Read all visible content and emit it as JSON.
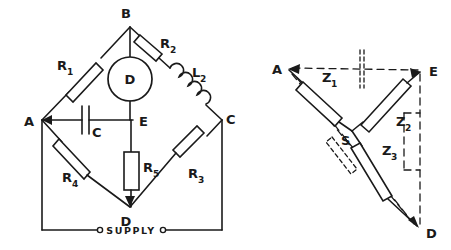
{
  "figure": {
    "background_color": "#ffffff",
    "line_color": "#1a1a1a"
  },
  "bridge": {
    "name": "ac-bridge-network",
    "nodes": [
      {
        "id": "A",
        "label": "A",
        "x": 42,
        "y": 120
      },
      {
        "id": "B",
        "label": "B",
        "x": 130,
        "y": 27
      },
      {
        "id": "C",
        "label": "C",
        "x": 222,
        "y": 120
      },
      {
        "id": "D",
        "label": "D",
        "x": 130,
        "y": 207
      },
      {
        "id": "E",
        "label": "E",
        "x": 133,
        "y": 120
      }
    ],
    "components": [
      {
        "id": "R1",
        "label": "R",
        "sub": "1",
        "type": "resistor",
        "branch": "A-B"
      },
      {
        "id": "R2",
        "label": "R",
        "sub": "2",
        "type": "resistor",
        "branch": "B-C"
      },
      {
        "id": "L2",
        "label": "L",
        "sub": "2",
        "type": "inductor",
        "branch": "B-C"
      },
      {
        "id": "R3",
        "label": "R",
        "sub": "3",
        "type": "resistor",
        "branch": "C-D"
      },
      {
        "id": "R4",
        "label": "R",
        "sub": "4",
        "type": "resistor",
        "branch": "A-D"
      },
      {
        "id": "R5",
        "label": "R",
        "sub": "5",
        "type": "resistor",
        "branch": "E-D"
      },
      {
        "id": "C",
        "label": "C",
        "sub": "",
        "type": "capacitor",
        "branch": "A-E"
      },
      {
        "id": "D",
        "label": "D",
        "sub": "",
        "type": "detector",
        "branch": "B-E"
      }
    ],
    "supply": {
      "label": "SUPPLY",
      "terminal_count": 2
    }
  },
  "star": {
    "name": "star-equivalent-network",
    "nodes": [
      {
        "id": "A",
        "label": "A",
        "x": 287,
        "y": 68
      },
      {
        "id": "E",
        "label": "E",
        "x": 424,
        "y": 72
      },
      {
        "id": "D",
        "label": "D",
        "x": 420,
        "y": 229
      },
      {
        "id": "S",
        "label": "S",
        "x": 352,
        "y": 131
      }
    ],
    "components": [
      {
        "id": "Z1",
        "label": "Z",
        "sub": "1",
        "type": "impedance",
        "branch": "A-S"
      },
      {
        "id": "Z2",
        "label": "Z",
        "sub": "2",
        "type": "impedance",
        "branch": "S-E"
      },
      {
        "id": "Z3",
        "label": "Z",
        "sub": "3",
        "type": "impedance",
        "branch": "S-D"
      }
    ],
    "construction_lines": "dashed"
  }
}
